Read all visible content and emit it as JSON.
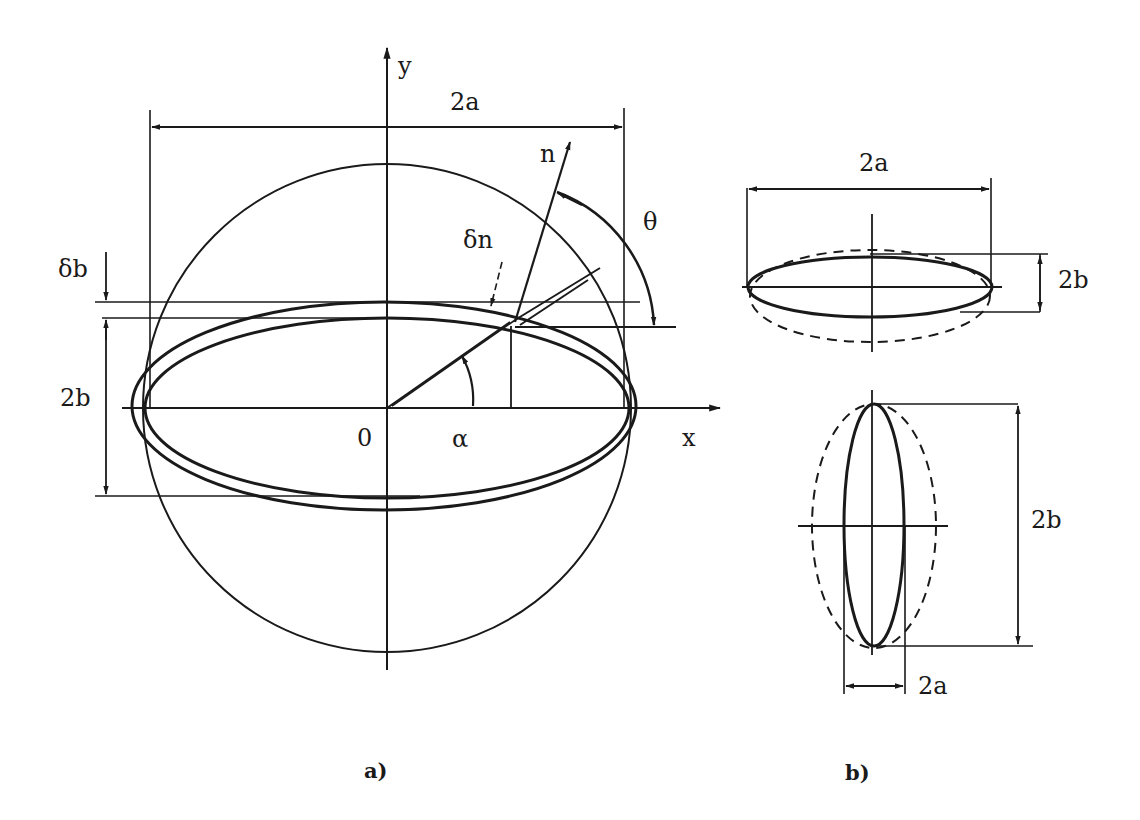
{
  "figure": {
    "panel_a": {
      "caption": "a)",
      "labels": {
        "y_axis": "y",
        "x_axis": "x",
        "origin": "0",
        "width_dimension": "2a",
        "height_dimension": "2b",
        "thickness_increment": "δb",
        "normal": "n",
        "normal_increment": "δn",
        "angle_theta": "θ",
        "angle_alpha": "α"
      }
    },
    "panel_b": {
      "caption": "b)",
      "top": {
        "width_dimension": "2a",
        "height_dimension": "2b"
      },
      "bottom": {
        "width_dimension": "2a",
        "height_dimension": "2b"
      }
    }
  },
  "colors": {
    "ink": "#1a1a1a",
    "background": "#ffffff"
  }
}
